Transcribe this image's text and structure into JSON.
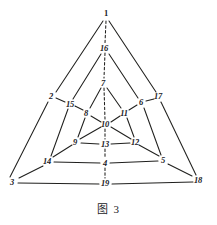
{
  "figure": {
    "caption_label": "图",
    "caption_number": "3",
    "caption_full": "图 3",
    "ink_color": "#20201e",
    "background_color": "#ffffff",
    "type": "graph-diagram"
  },
  "nodes": [
    {
      "id": "1",
      "label": "1",
      "x": 106,
      "y": 15,
      "label_x": 106,
      "label_y": 13,
      "style": "upright"
    },
    {
      "id": "16",
      "label": "16",
      "x": 105,
      "y": 48,
      "label_x": 104,
      "label_y": 48,
      "style": "italic"
    },
    {
      "id": "7",
      "label": "7",
      "x": 104,
      "y": 83,
      "label_x": 103,
      "label_y": 83,
      "style": "italic"
    },
    {
      "id": "2",
      "label": "2",
      "x": 52,
      "y": 97,
      "label_x": 51,
      "label_y": 96,
      "style": "italic"
    },
    {
      "id": "15",
      "label": "15",
      "x": 70,
      "y": 104,
      "label_x": 70,
      "label_y": 104,
      "style": "italic"
    },
    {
      "id": "8",
      "label": "8",
      "x": 87,
      "y": 113,
      "label_x": 86,
      "label_y": 113,
      "style": "italic"
    },
    {
      "id": "10",
      "label": "10",
      "x": 106,
      "y": 124,
      "label_x": 105,
      "label_y": 124,
      "style": "italic"
    },
    {
      "id": "11",
      "label": "11",
      "x": 124,
      "y": 113,
      "label_x": 124,
      "label_y": 113,
      "style": "italic"
    },
    {
      "id": "6",
      "label": "6",
      "x": 141,
      "y": 103,
      "label_x": 141,
      "label_y": 102,
      "style": "italic"
    },
    {
      "id": "17",
      "label": "17",
      "x": 158,
      "y": 97,
      "label_x": 158,
      "label_y": 96,
      "style": "italic"
    },
    {
      "id": "9",
      "label": "9",
      "x": 76,
      "y": 142,
      "label_x": 75,
      "label_y": 142,
      "style": "italic"
    },
    {
      "id": "13",
      "label": "13",
      "x": 105,
      "y": 144,
      "label_x": 105,
      "label_y": 144,
      "style": "italic"
    },
    {
      "id": "12",
      "label": "12",
      "x": 135,
      "y": 142,
      "label_x": 135,
      "label_y": 142,
      "style": "italic"
    },
    {
      "id": "14",
      "label": "14",
      "x": 48,
      "y": 161,
      "label_x": 47,
      "label_y": 161,
      "style": "italic"
    },
    {
      "id": "4",
      "label": "4",
      "x": 105,
      "y": 163,
      "label_x": 105,
      "label_y": 163,
      "style": "italic"
    },
    {
      "id": "5",
      "label": "5",
      "x": 163,
      "y": 160,
      "label_x": 163,
      "label_y": 160,
      "style": "italic"
    },
    {
      "id": "3",
      "label": "3",
      "x": 13,
      "y": 182,
      "label_x": 12,
      "label_y": 182,
      "style": "italic"
    },
    {
      "id": "19",
      "label": "19",
      "x": 105,
      "y": 183,
      "label_x": 105,
      "label_y": 183,
      "style": "italic"
    },
    {
      "id": "18",
      "label": "18",
      "x": 198,
      "y": 180,
      "label_x": 198,
      "label_y": 180,
      "style": "italic"
    }
  ],
  "edges_solid": [
    {
      "from": "1",
      "to": "2",
      "x1": 103,
      "y1": 21,
      "x2": 56,
      "y2": 92
    },
    {
      "from": "1",
      "to": "17",
      "x1": 109,
      "y1": 21,
      "x2": 156,
      "y2": 92
    },
    {
      "from": "2",
      "to": "3",
      "x1": 48,
      "y1": 102,
      "x2": 10,
      "y2": 177
    },
    {
      "from": "17",
      "to": "18",
      "x1": 161,
      "y1": 102,
      "x2": 196,
      "y2": 175
    },
    {
      "from": "3",
      "to": "19",
      "x1": 18,
      "y1": 183,
      "x2": 99,
      "y2": 184
    },
    {
      "from": "19",
      "to": "18",
      "x1": 112,
      "y1": 184,
      "x2": 193,
      "y2": 182
    },
    {
      "from": "16",
      "to": "15",
      "x1": 101,
      "y1": 54,
      "x2": 73,
      "y2": 99
    },
    {
      "from": "16",
      "to": "6",
      "x1": 109,
      "y1": 54,
      "x2": 138,
      "y2": 98
    },
    {
      "from": "15",
      "to": "2",
      "x1": 65,
      "y1": 102,
      "x2": 56,
      "y2": 98
    },
    {
      "from": "6",
      "to": "17",
      "x1": 146,
      "y1": 101,
      "x2": 154,
      "y2": 99
    },
    {
      "from": "15",
      "to": "14",
      "x1": 68,
      "y1": 109,
      "x2": 51,
      "y2": 156
    },
    {
      "from": "6",
      "to": "5",
      "x1": 144,
      "y1": 108,
      "x2": 161,
      "y2": 155
    },
    {
      "from": "14",
      "to": "4",
      "x1": 54,
      "y1": 162,
      "x2": 100,
      "y2": 163
    },
    {
      "from": "4",
      "to": "5",
      "x1": 110,
      "y1": 163,
      "x2": 158,
      "y2": 161
    },
    {
      "from": "14",
      "to": "3",
      "x1": 43,
      "y1": 166,
      "x2": 19,
      "y2": 178
    },
    {
      "from": "5",
      "to": "18",
      "x1": 168,
      "y1": 164,
      "x2": 192,
      "y2": 176
    },
    {
      "from": "7",
      "to": "8",
      "x1": 101,
      "y1": 88,
      "x2": 90,
      "y2": 108
    },
    {
      "from": "7",
      "to": "11",
      "x1": 107,
      "y1": 88,
      "x2": 121,
      "y2": 108
    },
    {
      "from": "8",
      "to": "15",
      "x1": 83,
      "y1": 110,
      "x2": 75,
      "y2": 106
    },
    {
      "from": "11",
      "to": "6",
      "x1": 129,
      "y1": 110,
      "x2": 137,
      "y2": 105
    },
    {
      "from": "8",
      "to": "10",
      "x1": 91,
      "y1": 116,
      "x2": 101,
      "y2": 122
    },
    {
      "from": "10",
      "to": "11",
      "x1": 111,
      "y1": 122,
      "x2": 120,
      "y2": 116
    },
    {
      "from": "8",
      "to": "9",
      "x1": 85,
      "y1": 118,
      "x2": 78,
      "y2": 137
    },
    {
      "from": "11",
      "to": "12",
      "x1": 127,
      "y1": 118,
      "x2": 134,
      "y2": 137
    },
    {
      "from": "9",
      "to": "10",
      "x1": 80,
      "y1": 139,
      "x2": 101,
      "y2": 127
    },
    {
      "from": "10",
      "to": "12",
      "x1": 111,
      "y1": 127,
      "x2": 131,
      "y2": 139
    },
    {
      "from": "9",
      "to": "13",
      "x1": 81,
      "y1": 143,
      "x2": 99,
      "y2": 144
    },
    {
      "from": "13",
      "to": "12",
      "x1": 111,
      "y1": 144,
      "x2": 130,
      "y2": 143
    },
    {
      "from": "9",
      "to": "14",
      "x1": 72,
      "y1": 145,
      "x2": 53,
      "y2": 157
    },
    {
      "from": "12",
      "to": "5",
      "x1": 139,
      "y1": 145,
      "x2": 159,
      "y2": 156
    }
  ],
  "edges_dashed": [
    {
      "from": "1",
      "to": "16",
      "x1": 106,
      "y1": 21,
      "x2": 105,
      "y2": 43
    },
    {
      "from": "16",
      "to": "7",
      "x1": 105,
      "y1": 53,
      "x2": 104,
      "y2": 78
    },
    {
      "from": "7",
      "to": "10",
      "x1": 104,
      "y1": 88,
      "x2": 105,
      "y2": 119
    },
    {
      "from": "10",
      "to": "13",
      "x1": 105,
      "y1": 129,
      "x2": 105,
      "y2": 139
    },
    {
      "from": "13",
      "to": "4",
      "x1": 105,
      "y1": 149,
      "x2": 105,
      "y2": 158
    },
    {
      "from": "4",
      "to": "19",
      "x1": 105,
      "y1": 168,
      "x2": 105,
      "y2": 178
    }
  ]
}
